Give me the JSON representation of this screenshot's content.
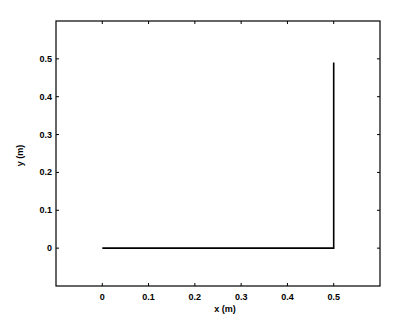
{
  "chart_data": {
    "type": "line",
    "title": "",
    "xlabel": "x (m)",
    "ylabel": "y (m)",
    "xlim": [
      -0.1,
      0.6
    ],
    "ylim": [
      -0.1,
      0.6
    ],
    "xticks": [
      0,
      0.1,
      0.2,
      0.3,
      0.4,
      0.5
    ],
    "xtick_labels": [
      "0",
      "0.1",
      "0.2",
      "0.3",
      "0.4",
      "0.5"
    ],
    "yticks": [
      0,
      0.1,
      0.2,
      0.3,
      0.4,
      0.5
    ],
    "ytick_labels": [
      "0",
      "0.1",
      "0.2",
      "0.3",
      "0.4",
      "0.5"
    ],
    "grid": false,
    "legend": null,
    "series": [
      {
        "name": "path",
        "color": "#000000",
        "x": [
          0,
          0.5,
          0.5
        ],
        "y": [
          0,
          0,
          0.49
        ]
      }
    ]
  },
  "plot": {
    "left": 56,
    "right": 380,
    "top": 21,
    "bottom": 286,
    "line_color": "#000000",
    "axis_color": "#000000"
  }
}
